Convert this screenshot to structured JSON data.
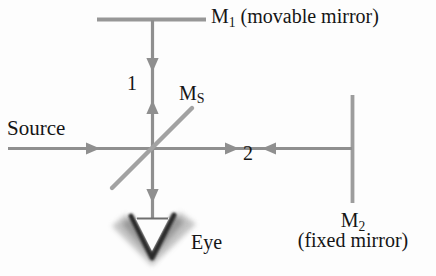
{
  "figure": {
    "background_color": "#fdfdfd",
    "line_color": "#8d8d8d",
    "text_color": "#151515",
    "width": 436,
    "height": 276
  },
  "labels": {
    "mirror1": {
      "symbol": "M",
      "subscript": "1",
      "caption": "(movable mirror)",
      "full": "M₁ (movable mirror)"
    },
    "mirror2": {
      "symbol": "M",
      "subscript": "2",
      "caption": "(fixed mirror)",
      "full": "M₂ (fixed mirror)"
    },
    "beam_splitter": {
      "symbol": "M",
      "subscript": "S",
      "full": "Mₛ"
    },
    "source": "Source",
    "eye": "Eye",
    "ray1": "1",
    "ray2": "2"
  },
  "components": [
    {
      "name": "movable-mirror",
      "label": "M1",
      "orientation": "horizontal",
      "x1": 97,
      "y1": 19,
      "x2": 206,
      "y2": 19
    },
    {
      "name": "fixed-mirror",
      "label": "M2",
      "orientation": "vertical",
      "x1": 352,
      "y1": 95,
      "x2": 352,
      "y2": 203
    },
    {
      "name": "beam-splitter",
      "label": "MS",
      "orientation": "diagonal-45",
      "x1": 112,
      "y1": 188,
      "x2": 192,
      "y2": 108
    },
    {
      "name": "beam-splitter-center",
      "x": 152,
      "y": 148
    }
  ],
  "rays": [
    {
      "name": "source-beam",
      "from": "Source",
      "to": "beam-splitter",
      "direction": "right",
      "x1": 8,
      "y1": 148,
      "x2": 152,
      "y2": 148,
      "arrow_at": [
        86
      ]
    },
    {
      "name": "arm-1-beam",
      "label": "1",
      "from": "beam-splitter",
      "to": "M1",
      "direction": "bidirectional-vertical",
      "x1": 152,
      "y1": 19,
      "x2": 152,
      "y2": 148,
      "arrow_down_at": 62,
      "arrow_up_at": 105
    },
    {
      "name": "arm-2-beam",
      "label": "2",
      "from": "beam-splitter",
      "to": "M2",
      "direction": "bidirectional-horizontal",
      "x1": 152,
      "y1": 148,
      "x2": 352,
      "y2": 148,
      "arrow_right_at": 232,
      "arrow_left_at": 278
    },
    {
      "name": "output-beam",
      "from": "beam-splitter",
      "to": "Eye",
      "direction": "down",
      "x1": 152,
      "y1": 148,
      "x2": 152,
      "y2": 218,
      "arrow_at": [
        193
      ]
    }
  ],
  "eye_symbol": {
    "name": "eye-wedge",
    "shape": "hollow-downward-V",
    "center_x": 152,
    "top_y": 215,
    "tip_y": 258
  }
}
